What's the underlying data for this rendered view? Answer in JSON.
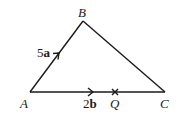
{
  "diagram": {
    "type": "vector-triangle",
    "vertices": {
      "A": {
        "label": "A",
        "x": 30,
        "y": 92
      },
      "B": {
        "label": "B",
        "x": 83,
        "y": 21
      },
      "C": {
        "label": "C",
        "x": 165,
        "y": 92
      }
    },
    "points": {
      "Q": {
        "label": "Q",
        "x": 115,
        "y": 92,
        "on": "AC",
        "marker": "cross"
      }
    },
    "vectors": [
      {
        "from": "A",
        "to": "B",
        "coefficient": "5",
        "symbol": "a",
        "label": "5a"
      },
      {
        "from": "A",
        "to": "C",
        "coefficient": "2",
        "symbol": "b",
        "label": "2b"
      }
    ],
    "edges": [
      "AB",
      "BC",
      "AC"
    ],
    "colors": {
      "stroke": "#1a1a1a",
      "background": "#ffffff"
    }
  }
}
